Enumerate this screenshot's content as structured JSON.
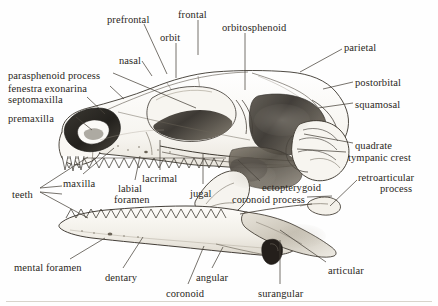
{
  "figure": {
    "style": "pencil-shaded anatomical line drawing",
    "width": 438,
    "height": 306,
    "ink_color": "#2a2722",
    "paper_color": "#fefefe",
    "leader_color": "#4a443c"
  },
  "labels": [
    {
      "id": "prefrontal",
      "text": "prefrontal",
      "x": 107,
      "y": 14,
      "align": "left"
    },
    {
      "id": "frontal",
      "text": "frontal",
      "x": 178,
      "y": 9,
      "align": "left"
    },
    {
      "id": "orbitosphenoid",
      "text": "orbitosphenoid",
      "x": 222,
      "y": 22,
      "align": "left"
    },
    {
      "id": "orbit",
      "text": "orbit",
      "x": 160,
      "y": 32,
      "align": "left"
    },
    {
      "id": "parietal",
      "text": "parietal",
      "x": 344,
      "y": 42,
      "align": "left"
    },
    {
      "id": "nasal",
      "text": "nasal",
      "x": 119,
      "y": 55,
      "align": "left"
    },
    {
      "id": "parasphenoid-process",
      "text": "parasphenoid process",
      "x": 8,
      "y": 70,
      "align": "left"
    },
    {
      "id": "postorbital",
      "text": "postorbital",
      "x": 355,
      "y": 77,
      "align": "left"
    },
    {
      "id": "fenestra-exonarina",
      "text": "fenestra exonarina",
      "x": 8,
      "y": 83,
      "align": "left"
    },
    {
      "id": "septomaxilla",
      "text": "septomaxilla",
      "x": 8,
      "y": 94,
      "align": "left"
    },
    {
      "id": "squamosal",
      "text": "squamosal",
      "x": 355,
      "y": 99,
      "align": "left"
    },
    {
      "id": "premaxilla",
      "text": "premaxilla",
      "x": 8,
      "y": 113,
      "align": "left"
    },
    {
      "id": "quadrate",
      "text": "quadrate",
      "x": 355,
      "y": 140,
      "align": "left"
    },
    {
      "id": "tympanic-crest",
      "text": "tympanic crest",
      "x": 348,
      "y": 152,
      "align": "left"
    },
    {
      "id": "maxilla",
      "text": "maxilla",
      "x": 63,
      "y": 178,
      "align": "left"
    },
    {
      "id": "lacrimal",
      "text": "lacrimal",
      "x": 142,
      "y": 173,
      "align": "left"
    },
    {
      "id": "jugal",
      "text": "jugal",
      "x": 190,
      "y": 188,
      "align": "left"
    },
    {
      "id": "ectopterygoid",
      "text": "ectopterygoid",
      "x": 262,
      "y": 182,
      "align": "left"
    },
    {
      "id": "retroarticular",
      "text": "retroarticular",
      "x": 358,
      "y": 172,
      "align": "left"
    },
    {
      "id": "process",
      "text": "process",
      "x": 380,
      "y": 183,
      "align": "left"
    },
    {
      "id": "teeth",
      "text": "teeth",
      "x": 12,
      "y": 189,
      "align": "left"
    },
    {
      "id": "labial",
      "text": "labial",
      "x": 118,
      "y": 183,
      "align": "left"
    },
    {
      "id": "foramen",
      "text": "foramen",
      "x": 114,
      "y": 194,
      "align": "left"
    },
    {
      "id": "coronoid-process",
      "text": "coronoid process",
      "x": 232,
      "y": 194,
      "align": "left"
    },
    {
      "id": "mental-foramen",
      "text": "mental foramen",
      "x": 14,
      "y": 262,
      "align": "left"
    },
    {
      "id": "dentary",
      "text": "dentary",
      "x": 105,
      "y": 272,
      "align": "left"
    },
    {
      "id": "angular",
      "text": "angular",
      "x": 196,
      "y": 272,
      "align": "left"
    },
    {
      "id": "coronoid",
      "text": "coronoid",
      "x": 166,
      "y": 288,
      "align": "left"
    },
    {
      "id": "surangular",
      "text": "surangular",
      "x": 258,
      "y": 288,
      "align": "left"
    },
    {
      "id": "articular",
      "text": "articular",
      "x": 328,
      "y": 265,
      "align": "left"
    }
  ],
  "leaders": [
    {
      "id": "leader-prefrontal",
      "d": "M 144 24 L 167 74"
    },
    {
      "id": "leader-frontal",
      "d": "M 198 20 L 198 55"
    },
    {
      "id": "leader-orbit",
      "d": "M 176 43 L 176 78"
    },
    {
      "id": "leader-orbitosphenoid",
      "d": "M 245 33 L 245 90"
    },
    {
      "id": "leader-parietal",
      "d": "M 342 49 L 300 72"
    },
    {
      "id": "leader-nasal",
      "d": "M 142 61 L 152 76"
    },
    {
      "id": "leader-parasphenoid",
      "d": "M 113 73 L 196 108"
    },
    {
      "id": "leader-postorbital",
      "d": "M 353 82 L 323 89"
    },
    {
      "id": "leader-fenestra",
      "d": "M 110 86 L 124 99"
    },
    {
      "id": "leader-septomaxilla",
      "d": "M 87 97 L 105 114"
    },
    {
      "id": "leader-squamosal",
      "d": "M 353 103 L 318 108"
    },
    {
      "id": "leader-premaxilla",
      "d": "M 76 117 L 92 130"
    },
    {
      "id": "leader-quadrate",
      "d": "M 353 143 L 304 134"
    },
    {
      "id": "leader-tympanic",
      "d": "M 346 152 L 297 149"
    },
    {
      "id": "leader-maxilla",
      "d": "M 83 174 L 114 148"
    },
    {
      "id": "leader-lacrimal",
      "d": "M 160 170 L 160 140"
    },
    {
      "id": "leader-jugal",
      "d": "M 203 184 L 203 154"
    },
    {
      "id": "leader-ectopterygoid",
      "d": "M 260 181 L 238 160"
    },
    {
      "id": "leader-retro",
      "d": "M 357 180 L 330 206"
    },
    {
      "id": "leader-teeth-upper",
      "d": "M 40 188 L 88 157"
    },
    {
      "id": "leader-teeth-lower",
      "d": "M 40 192 L 88 218"
    },
    {
      "id": "leader-labial",
      "d": "M 135 180 L 140 156"
    },
    {
      "id": "leader-coronoid-process",
      "d": "M 307 197 L 332 196"
    },
    {
      "id": "leader-mental",
      "d": "M 70 259 L 105 238"
    },
    {
      "id": "leader-dentary",
      "d": "M 123 268 L 143 237"
    },
    {
      "id": "leader-angular",
      "d": "M 212 268 L 223 247"
    },
    {
      "id": "leader-coronoid",
      "d": "M 188 284 L 204 246"
    },
    {
      "id": "leader-surangular",
      "d": "M 280 284 L 280 240"
    },
    {
      "id": "leader-articular",
      "d": "M 326 262 L 280 230"
    }
  ]
}
